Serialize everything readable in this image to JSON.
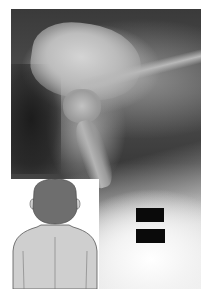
{
  "image": {
    "description": "Lateral radiograph of the upper cervical spine and skull base with an inset illustration of a child viewed from behind",
    "xray": {
      "view": "lateral",
      "region": "craniocervical junction / upper cervical spine"
    },
    "inset_illustration": {
      "subject": "child seen from behind (head and shoulders)",
      "colors": {
        "head": "#6e6e6e",
        "body": "#cfcfcf",
        "outline": "#555555",
        "background": "#ffffff"
      }
    },
    "redaction_marks": [
      {
        "id": "redaction-bar-top"
      },
      {
        "id": "redaction-bar-bottom"
      }
    ],
    "colors": {
      "page_background": "#ffffff",
      "redaction": "#0a0a0a"
    }
  }
}
